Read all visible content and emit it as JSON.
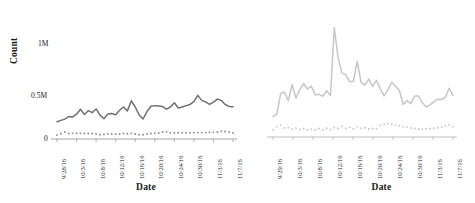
{
  "figure": {
    "background": "#ffffff",
    "panel_count": 2
  },
  "chart_data": [
    {
      "type": "line",
      "panel": "left",
      "title": "",
      "xlabel": "Date",
      "ylabel": "Count",
      "grid": false,
      "legend": "none",
      "ylim": [
        0,
        1000000
      ],
      "ytick_labels": [
        "1M",
        "0.5M",
        "0"
      ],
      "ytick_values": [
        1000000,
        500000,
        0
      ],
      "xtick_labels": [
        "9/28/16",
        "10/3/16",
        "10/8/16",
        "10/12/16",
        "10/16/16",
        "10/20/16",
        "10/24/16",
        "10/30/16",
        "11/3/16",
        "11/7/16"
      ],
      "series": [
        {
          "name": "primary",
          "style": "solid",
          "color": "#707070",
          "values": [
            178000,
            192000,
            205000,
            232000,
            228000,
            256000,
            306000,
            252000,
            292000,
            272000,
            310000,
            246000,
            208000,
            258000,
            262000,
            250000,
            296000,
            330000,
            290000,
            394000,
            330000,
            248000,
            206000,
            282000,
            338000,
            344000,
            340000,
            334000,
            308000,
            330000,
            374000,
            320000,
            330000,
            344000,
            356000,
            386000,
            450000,
            398000,
            382000,
            356000,
            380000,
            412000,
            396000,
            356000,
            336000,
            332000
          ]
        },
        {
          "name": "secondary",
          "style": "dotted",
          "color": "#8c8c8c",
          "values": [
            40000,
            54000,
            72000,
            56000,
            58000,
            60000,
            58000,
            56000,
            56000,
            56000,
            52000,
            44000,
            46000,
            52000,
            52000,
            50000,
            52000,
            56000,
            54000,
            58000,
            52000,
            44000,
            44000,
            52000,
            56000,
            58000,
            62000,
            72000,
            74000,
            64000,
            62000,
            64000,
            64000,
            62000,
            64000,
            64000,
            66000,
            66000,
            66000,
            68000,
            70000,
            72000,
            80000,
            78000,
            72000,
            62000
          ]
        }
      ]
    },
    {
      "type": "line",
      "panel": "right",
      "title": "",
      "xlabel": "Date",
      "ylabel": "",
      "grid": false,
      "legend": "none",
      "ytick_labels": [],
      "xtick_labels": [
        "9/29/16",
        "10/3/16",
        "10/8/16",
        "10/12/16",
        "10/16/16",
        "10/20/16",
        "10/24/16",
        "10/30/16",
        "11/3/16",
        "11/7/16"
      ],
      "series": [
        {
          "name": "primary",
          "style": "solid",
          "color": "#c7c7c7",
          "values": [
            170000,
            186000,
            360000,
            372000,
            300000,
            432000,
            320000,
            392000,
            442000,
            396000,
            420000,
            350000,
            354000,
            336000,
            382000,
            342000,
            902000,
            656000,
            528000,
            516000,
            456000,
            460000,
            626000,
            452000,
            430000,
            478000,
            418000,
            468000,
            398000,
            340000,
            390000,
            452000,
            420000,
            384000,
            268000,
            300000,
            276000,
            338000,
            338000,
            284000,
            248000,
            266000,
            290000,
            312000,
            310000,
            328000,
            404000,
            342000
          ]
        },
        {
          "name": "secondary",
          "style": "dotted",
          "color": "#c7c7c7",
          "values": [
            60000,
            84000,
            98000,
            74000,
            78000,
            66000,
            72000,
            62000,
            68000,
            60000,
            64000,
            58000,
            70000,
            60000,
            72000,
            62000,
            78000,
            70000,
            88000,
            70000,
            80000,
            68000,
            84000,
            72000,
            76000,
            66000,
            70000,
            68000,
            96000,
            104000,
            112000,
            108000,
            100000,
            92000,
            86000,
            82000,
            74000,
            70000,
            66000,
            64000,
            66000,
            70000,
            72000,
            76000,
            82000,
            92000,
            100000,
            86000
          ]
        }
      ]
    }
  ]
}
